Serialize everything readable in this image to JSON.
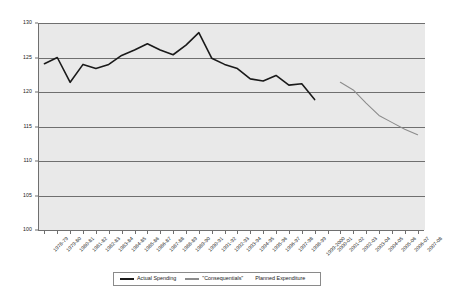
{
  "chart_data": {
    "type": "line",
    "title": "",
    "xlabel": "",
    "ylabel": "",
    "ylim": [
      100,
      130
    ],
    "y_ticks": [
      100,
      105,
      110,
      115,
      120,
      125,
      130
    ],
    "grid": true,
    "legend_position": "bottom",
    "categories": [
      "1978-79",
      "1979-80",
      "1980-81",
      "1981-82",
      "1982-83",
      "1983-84",
      "1984-85",
      "1985-86",
      "1986-87",
      "1987-88",
      "1988-89",
      "1989-90",
      "1990-91",
      "1991-92",
      "1992-93",
      "1993-94",
      "1994-95",
      "1995-96",
      "1996-97",
      "1997-98",
      "1998-99",
      "1999-2000",
      "2000-01",
      "2001-02",
      "2002-03",
      "2003-04",
      "2004-05",
      "2005-06",
      "2006-07",
      "2007-08"
    ],
    "series": [
      {
        "name": "Actual Spending",
        "color": "#1a1a1a",
        "x": [
          "1978-79",
          "1979-80",
          "1980-81",
          "1981-82",
          "1982-83",
          "1983-84",
          "1984-85",
          "1985-86",
          "1986-87",
          "1987-88",
          "1988-89",
          "1989-90",
          "1990-91",
          "1991-92",
          "1992-93",
          "1993-94",
          "1994-95",
          "1995-96",
          "1996-97",
          "1997-98",
          "1998-99",
          "1999-2000"
        ],
        "values": [
          124.1,
          125.0,
          121.4,
          124.0,
          123.4,
          124.0,
          125.3,
          126.1,
          127.0,
          126.1,
          125.4,
          126.8,
          128.6,
          124.9,
          124.0,
          123.4,
          121.9,
          121.6,
          122.4,
          121.0,
          121.2,
          118.9
        ]
      },
      {
        "name": "\"Consequentials\"",
        "color": "#8c8c8c",
        "x": [
          "2001-02",
          "2002-03",
          "2003-04",
          "2004-05",
          "2005-06",
          "2006-07",
          "2007-08"
        ],
        "values": [
          121.4,
          120.3,
          118.4,
          116.6,
          115.6,
          114.6,
          113.8
        ]
      },
      {
        "name": "Planned Expenditure",
        "color": "#ffffff",
        "x": [],
        "values": []
      }
    ]
  },
  "y_axis": {
    "ticks": [
      "130",
      "125",
      "120",
      "115",
      "110",
      "105",
      "100"
    ]
  },
  "x_axis": {
    "labels": [
      "1978-79",
      "1979-80",
      "1980-81",
      "1981-82",
      "1982-83",
      "1983-84",
      "1984-85",
      "1985-86",
      "1986-87",
      "1987-88",
      "1988-89",
      "1989-90",
      "1990-91",
      "1991-92",
      "1992-93",
      "1993-94",
      "1994-95",
      "1995-96",
      "1996-97",
      "1997-98",
      "1998-99",
      "1999-2000",
      "2000-01",
      "2001-02",
      "2002-03",
      "2003-04",
      "2004-05",
      "2005-06",
      "2006-07",
      "2007-08"
    ]
  },
  "legend": {
    "items": [
      {
        "label": "Actual Spending",
        "color": "#1a1a1a",
        "has_swatch": true
      },
      {
        "label": "\"Consequentials\"",
        "color": "#8c8c8c",
        "has_swatch": true
      },
      {
        "label": "Planned Expenditure",
        "color": "#ffffff",
        "has_swatch": false
      }
    ]
  },
  "colors": {
    "plot_background": "#e9e9e9",
    "gridline": "#6f6f6f",
    "actual_spending": "#1a1a1a",
    "consequentials": "#8c8c8c"
  }
}
